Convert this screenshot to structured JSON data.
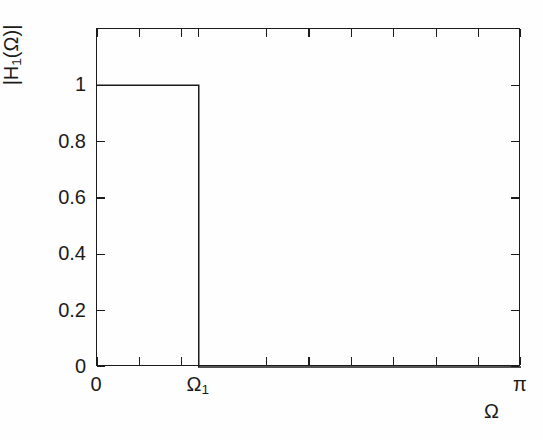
{
  "chart_data": {
    "type": "line",
    "title": "",
    "subtitle": "",
    "xlabel": "Ω",
    "ylabel": "|H₁(Ω)|",
    "ylabel_parts": {
      "pre": "|H",
      "sub": "1",
      "post": "(Ω)|"
    },
    "grid": false,
    "legend": null,
    "xlim": [
      0,
      3.141592653589793
    ],
    "ylim": [
      0,
      1.2
    ],
    "x_tick_labels": [
      "0",
      "Ω₁",
      "π"
    ],
    "x_tick_positions": [
      0.0,
      0.7539822,
      3.1415927
    ],
    "x_tick_count": 11,
    "y_tick_labels": [
      "0",
      "0.2",
      "0.4",
      "0.6",
      "0.8",
      "1"
    ],
    "y_tick_values": [
      0,
      0.2,
      0.4,
      0.6,
      0.8,
      1
    ],
    "cutoff_label": "Ω₁",
    "cutoff_value": 0.7539822,
    "passband_gain": 1,
    "stopband_gain": 0,
    "series": [
      {
        "name": "|H₁(Ω)|",
        "x": [
          0.0,
          0.7539822,
          0.7539822,
          3.1415927
        ],
        "y": [
          1,
          1,
          0,
          0
        ]
      }
    ],
    "line_color": "#1b1b1b",
    "background_color": "#ffffff"
  },
  "axis": {
    "x_ticks": [
      {
        "label": "0",
        "pos": 0.0
      },
      {
        "label": "",
        "pos": 0.3141593
      },
      {
        "label": "",
        "pos": 0.6283185
      },
      {
        "label": "Ω₁",
        "pos": 0.7539822
      },
      {
        "label": "",
        "pos": 1.2566371
      },
      {
        "label": "",
        "pos": 1.5707963
      },
      {
        "label": "",
        "pos": 1.8849556
      },
      {
        "label": "",
        "pos": 2.1991149
      },
      {
        "label": "",
        "pos": 2.5132741
      },
      {
        "label": "",
        "pos": 2.8274334
      },
      {
        "label": "π",
        "pos": 3.1415927
      }
    ],
    "y_ticks": [
      {
        "label": "1",
        "value": 1.0
      },
      {
        "label": "0.8",
        "value": 0.8
      },
      {
        "label": "0.6",
        "value": 0.6
      },
      {
        "label": "0.4",
        "value": 0.4
      },
      {
        "label": "0.2",
        "value": 0.2
      },
      {
        "label": "0",
        "value": 0.0
      }
    ]
  }
}
